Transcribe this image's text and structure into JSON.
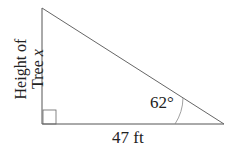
{
  "diagram": {
    "type": "right-triangle",
    "side_label_vertical_line1": "Height of",
    "side_label_vertical_line2_prefix": "Tree ",
    "side_label_vertical_variable": "x",
    "base_label": "47 ft",
    "angle_label": "62°",
    "line_color": "#555555"
  }
}
